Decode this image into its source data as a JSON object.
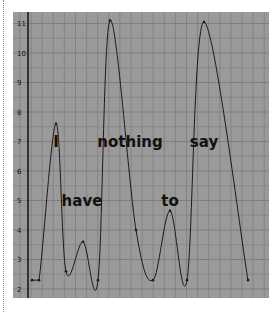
{
  "chart_data": {
    "type": "line",
    "title": "",
    "xlabel": "",
    "ylabel": "",
    "ylim": [
      2,
      11
    ],
    "yticks": [
      2,
      3,
      4,
      5,
      6,
      7,
      8,
      9,
      10,
      11
    ],
    "grid": true,
    "legend": null,
    "colors": {
      "background": "#9a9a9a",
      "grid": "#7e7e7e",
      "line": "#1a1a1a",
      "axis": "#111111"
    },
    "series": [
      {
        "name": "intonation",
        "x": [
          32,
          39,
          56,
          66,
          83,
          98,
          110,
          136,
          153,
          170,
          187,
          204,
          248
        ],
        "values": [
          2.3,
          2.3,
          7.6,
          2.6,
          3.6,
          2.3,
          11.1,
          4.0,
          2.3,
          4.65,
          2.3,
          11.05,
          2.3
        ]
      }
    ],
    "annotations": [
      {
        "text": "I",
        "x": 56,
        "y": 7.0
      },
      {
        "text": "have",
        "x": 82,
        "y": 5.0
      },
      {
        "text": "nothing",
        "x": 130,
        "y": 7.0
      },
      {
        "text": "to",
        "x": 170,
        "y": 5.0
      },
      {
        "text": "say",
        "x": 204,
        "y": 7.0
      }
    ]
  }
}
